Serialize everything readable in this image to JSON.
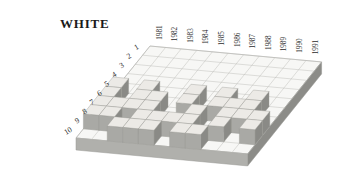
{
  "title": "WHITE",
  "colors": {
    "slab_top": "#f7f7f5",
    "slab_grid": "#b9b9b5",
    "slab_side_right": "#8c8c88",
    "slab_side_front": "#b0b0ac",
    "block_top": "#eceae6",
    "block_front": "#a9a9a5",
    "block_side": "#8a8a86",
    "outline": "#9a9a96",
    "text": "#1a1a1a",
    "background": "#ffffff"
  },
  "chart_data": {
    "type": "heatmap",
    "title": "WHITE",
    "xlabel": "",
    "ylabel": "",
    "grid": true,
    "legend_position": "none",
    "projection": "isometric-3d",
    "columns": 11,
    "rows": 10,
    "value_levels": [
      0,
      1
    ],
    "categories": [
      "1981",
      "1982",
      "1983",
      "1984",
      "1985",
      "1986",
      "1987",
      "1988",
      "1989",
      "1990",
      "1991"
    ],
    "row_labels": [
      "1",
      "2",
      "3",
      "4",
      "5",
      "6",
      "7",
      "8",
      "9",
      "10"
    ],
    "series": [
      {
        "name": "1",
        "values": [
          0,
          0,
          0,
          0,
          0,
          0,
          0,
          0,
          0,
          0,
          0
        ]
      },
      {
        "name": "2",
        "values": [
          0,
          0,
          0,
          0,
          0,
          0,
          0,
          0,
          0,
          0,
          0
        ]
      },
      {
        "name": "3",
        "values": [
          0,
          0,
          0,
          0,
          0,
          0,
          0,
          0,
          0,
          0,
          0
        ]
      },
      {
        "name": "4",
        "values": [
          0,
          0,
          0,
          0,
          0,
          0,
          0,
          0,
          0,
          0,
          0
        ]
      },
      {
        "name": "5",
        "values": [
          0,
          0,
          0,
          0,
          0,
          0,
          0,
          0,
          0,
          0,
          0
        ]
      },
      {
        "name": "6",
        "values": [
          1,
          0,
          1,
          0,
          0,
          1,
          0,
          1,
          0,
          1,
          0
        ]
      },
      {
        "name": "7",
        "values": [
          1,
          0,
          1,
          1,
          0,
          1,
          0,
          1,
          1,
          1,
          0
        ]
      },
      {
        "name": "8",
        "values": [
          1,
          1,
          1,
          1,
          0,
          0,
          1,
          0,
          1,
          1,
          1
        ]
      },
      {
        "name": "9",
        "values": [
          1,
          1,
          0,
          1,
          1,
          1,
          1,
          0,
          1,
          0,
          1
        ]
      },
      {
        "name": "10",
        "values": [
          0,
          0,
          1,
          1,
          1,
          0,
          1,
          1,
          0,
          0,
          0
        ]
      }
    ]
  },
  "geometry": {
    "origin_x": 150,
    "origin_y": 46,
    "col_dx": 15.6,
    "col_dy": 1.45,
    "row_dx": -7.4,
    "row_dy": 9.2,
    "slab_thickness": 12,
    "block_height": 15,
    "year_label_offset": 7,
    "row_label_offset": 7,
    "title_x": 60,
    "title_y": 28,
    "title_size": 13,
    "tick_size": 7.2
  }
}
